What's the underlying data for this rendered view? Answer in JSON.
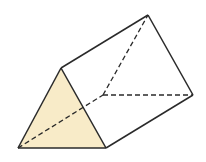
{
  "diagram": {
    "title": "",
    "shape": "triangular-prism",
    "colors": {
      "face_fill": "#f8ebc8",
      "edge": "#2a2a2a",
      "background": "#ffffff"
    },
    "vertices": {
      "A_front_top": [
        61,
        68
      ],
      "B_front_left": [
        18,
        148
      ],
      "C_front_right": [
        106,
        148
      ],
      "D_back_top": [
        148,
        15
      ],
      "E_back_left_hidden": [
        103,
        95
      ],
      "F_back_right": [
        193,
        95
      ]
    },
    "solid_edges": [
      [
        "A",
        "B"
      ],
      [
        "B",
        "C"
      ],
      [
        "C",
        "A"
      ],
      [
        "A",
        "D"
      ],
      [
        "D",
        "F"
      ],
      [
        "C",
        "F"
      ]
    ],
    "dashed_edges": [
      [
        "B",
        "E"
      ],
      [
        "E",
        "D"
      ],
      [
        "E",
        "F"
      ]
    ],
    "shaded_face": [
      "A",
      "B",
      "C"
    ]
  }
}
